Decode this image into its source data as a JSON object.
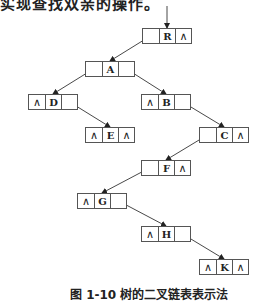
{
  "header": {
    "text": "实现查找双亲的操作。"
  },
  "diagram": {
    "null_symbol": "∧",
    "nodes": [
      {
        "id": "R",
        "label": "R",
        "left": "",
        "right": "∧",
        "x": 142,
        "y": 28
      },
      {
        "id": "A",
        "label": "A",
        "left": "",
        "right": "",
        "x": 85,
        "y": 61
      },
      {
        "id": "D",
        "label": "D",
        "left": "∧",
        "right": "",
        "x": 28,
        "y": 94
      },
      {
        "id": "B",
        "label": "B",
        "left": "∧",
        "right": "",
        "x": 141,
        "y": 94
      },
      {
        "id": "E",
        "label": "E",
        "left": "∧",
        "right": "∧",
        "x": 85,
        "y": 127
      },
      {
        "id": "C",
        "label": "C",
        "left": "",
        "right": "∧",
        "x": 199,
        "y": 127
      },
      {
        "id": "F",
        "label": "F",
        "left": "",
        "right": "∧",
        "x": 141,
        "y": 160
      },
      {
        "id": "G",
        "label": "G",
        "left": "∧",
        "right": "",
        "x": 77,
        "y": 193
      },
      {
        "id": "H",
        "label": "H",
        "left": "∧",
        "right": "",
        "x": 141,
        "y": 226
      },
      {
        "id": "K",
        "label": "K",
        "left": "∧",
        "right": "∧",
        "x": 199,
        "y": 259
      }
    ],
    "edges": [
      {
        "from": "R",
        "to": "A",
        "side": "left"
      },
      {
        "from": "A",
        "to": "D",
        "side": "left"
      },
      {
        "from": "A",
        "to": "B",
        "side": "right"
      },
      {
        "from": "D",
        "to": "E",
        "side": "right"
      },
      {
        "from": "B",
        "to": "C",
        "side": "right"
      },
      {
        "from": "C",
        "to": "F",
        "side": "left"
      },
      {
        "from": "F",
        "to": "G",
        "side": "left"
      },
      {
        "from": "G",
        "to": "H",
        "side": "right"
      },
      {
        "from": "H",
        "to": "K",
        "side": "right"
      }
    ],
    "entry_pointer": {
      "to": "R"
    }
  },
  "caption": {
    "text": "图 1-10  树的二叉链表表示法"
  }
}
